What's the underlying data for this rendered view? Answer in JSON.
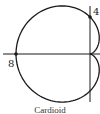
{
  "figure": {
    "caption": "Cardioid",
    "curve": {
      "type": "cardioid",
      "equation_form": "r = a(1 - cos θ)",
      "a": 4
    },
    "points": [
      {
        "label": "8",
        "x": -8,
        "y": 0
      },
      {
        "label": "4",
        "x": 0,
        "y": 4
      }
    ],
    "colors": {
      "stroke": "#1a1a1a",
      "background": "#ffffff"
    }
  },
  "chart_data": {
    "type": "line",
    "title": "Cardioid",
    "xlabel": "",
    "ylabel": "",
    "series": [
      {
        "name": "r = 4(1 - cos θ)",
        "description": "cardioid with cusp at origin, opening left"
      }
    ],
    "annotations": [
      {
        "text": "8",
        "x": -8,
        "y": 0
      },
      {
        "text": "4",
        "x": 0,
        "y": 4
      }
    ],
    "grid": false
  }
}
